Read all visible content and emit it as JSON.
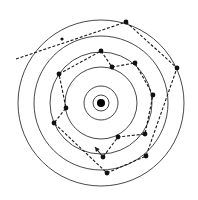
{
  "diagram": {
    "type": "concentric-rings-random-walk",
    "center": {
      "x": 101,
      "y": 103
    },
    "nucleus_radius": 4,
    "ring_radii": [
      8,
      17,
      36,
      51,
      67,
      83
    ],
    "colors": {
      "ring": "#333333",
      "path": "#1a1a1a",
      "node": "#111111",
      "nucleus": "#000000"
    },
    "entry_line": {
      "from": {
        "x": 16,
        "y": 59
      },
      "to": {
        "x": 126,
        "y": 22
      },
      "mid_node": {
        "x": 62,
        "y": 39
      }
    },
    "nodes": [
      {
        "x": 126,
        "y": 22
      },
      {
        "x": 177,
        "y": 68
      },
      {
        "x": 146,
        "y": 156
      },
      {
        "x": 107,
        "y": 173
      },
      {
        "x": 54,
        "y": 123
      },
      {
        "x": 66,
        "y": 108
      },
      {
        "x": 59,
        "y": 74
      },
      {
        "x": 101,
        "y": 51
      },
      {
        "x": 112,
        "y": 67
      },
      {
        "x": 135,
        "y": 63
      },
      {
        "x": 153,
        "y": 95
      },
      {
        "x": 145,
        "y": 134
      },
      {
        "x": 118,
        "y": 137
      },
      {
        "x": 103,
        "y": 157
      }
    ],
    "arrow": {
      "from": {
        "x": 103,
        "y": 157
      },
      "to": {
        "x": 95,
        "y": 147
      }
    }
  }
}
